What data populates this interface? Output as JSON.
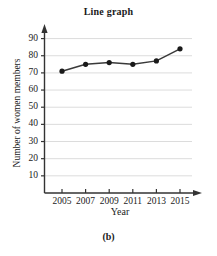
{
  "chart_data": {
    "type": "line",
    "title": "Line graph",
    "xlabel": "Year",
    "ylabel": "Number of women members",
    "caption": "(b)",
    "categories": [
      2005,
      2007,
      2009,
      2011,
      2013,
      2015
    ],
    "x_tick_labels": [
      "2005",
      "2007",
      "2009",
      "2011",
      "2013",
      "2015"
    ],
    "values": [
      71,
      75,
      76,
      75,
      77,
      84
    ],
    "y_tick_labels": [
      "90",
      "80",
      "70",
      "60",
      "50",
      "40",
      "30",
      "20",
      "10"
    ],
    "y_ticks": [
      90,
      80,
      70,
      60,
      50,
      40,
      30,
      20,
      10
    ],
    "ylim": [
      0,
      95
    ],
    "xlim": [
      2004,
      2016
    ],
    "grid": true,
    "legend": null,
    "series_color": "#1a1a1a",
    "grid_color": "#dcdcdc",
    "axis_color": "#333333",
    "marker": "filled-circle"
  }
}
